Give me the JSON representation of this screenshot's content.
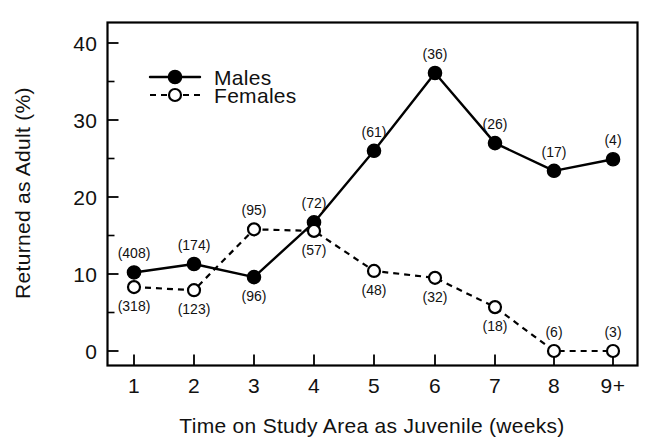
{
  "chart_data": {
    "type": "line",
    "title": "",
    "xlabel": "Time on Study Area as Juvenile (weeks)",
    "ylabel": "Returned as Adult (%)",
    "categories": [
      "1",
      "2",
      "3",
      "4",
      "5",
      "6",
      "7",
      "8",
      "9+"
    ],
    "x_tick_labels": [
      "1",
      "2",
      "3",
      "4",
      "5",
      "6",
      "7",
      "8",
      "9+"
    ],
    "y_tick_labels": [
      "0",
      "10",
      "20",
      "30",
      "40"
    ],
    "y_tick_values": [
      0,
      10,
      20,
      30,
      40
    ],
    "y_minor_tick_values": [
      5,
      15,
      25,
      35
    ],
    "ylim": [
      -2.5,
      42
    ],
    "xlim": [
      0.55,
      9.45
    ],
    "grid": false,
    "legend_position": "upper-left-inside",
    "series": [
      {
        "name": "Males",
        "marker": "filled-circle",
        "line_style": "solid",
        "color": "#000000",
        "values": [
          10.2,
          11.3,
          9.6,
          16.7,
          26.0,
          36.1,
          27.0,
          23.4,
          24.9
        ],
        "point_labels": [
          "(408)",
          "(174)",
          "(96)",
          "(72)",
          "(61)",
          "(36)",
          "(26)",
          "(17)",
          "(4)"
        ],
        "label_positions": [
          "above",
          "above",
          "below",
          "above",
          "above",
          "above",
          "above",
          "above",
          "above"
        ]
      },
      {
        "name": "Females",
        "marker": "open-circle",
        "line_style": "dashed",
        "color": "#000000",
        "values": [
          8.3,
          7.9,
          15.8,
          15.6,
          10.4,
          9.5,
          5.7,
          0.0,
          0.0
        ],
        "point_labels": [
          "(318)",
          "(123)",
          "(95)",
          "(57)",
          "(48)",
          "(32)",
          "(18)",
          "(6)",
          "(3)"
        ],
        "label_positions": [
          "below",
          "below",
          "above",
          "below",
          "below",
          "below",
          "below",
          "above",
          "above"
        ]
      }
    ]
  },
  "legend": {
    "items": [
      {
        "label": "Males",
        "style": "solid-filled"
      },
      {
        "label": "Females",
        "style": "dashed-open"
      }
    ]
  },
  "axes": {
    "x_title": "Time on Study Area as Juvenile (weeks)",
    "y_title": "Returned as Adult (%)"
  }
}
